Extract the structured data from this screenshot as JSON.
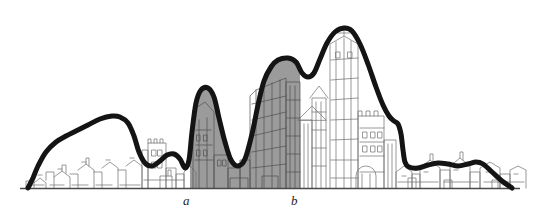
{
  "figure": {
    "type": "skyline-profile-diagram",
    "title": "",
    "background_color": "#ffffff",
    "ground_line_y": 188,
    "ground_line_color": "#4a4a4a",
    "profile_curve_color": "#141414",
    "profile_curve_width": 5,
    "shaded_zone_color": "#9b9b9b",
    "skyline_ink_color": "#6e6e6e"
  },
  "labels": [
    {
      "id": "a",
      "text": "a",
      "x": 186,
      "y": 204,
      "style": "italic"
    },
    {
      "id": "b",
      "text": "b",
      "x": 294,
      "y": 204,
      "style": "italic"
    }
  ],
  "chart_data": {
    "type": "area",
    "title": "",
    "xlabel": "",
    "ylabel": "",
    "grid": false,
    "legend": null,
    "annotations": [
      {
        "label": "a",
        "x": 186,
        "note": "left boundary of shaded high-density zone"
      },
      {
        "label": "b",
        "x": 300,
        "note": "right boundary of shaded high-density zone"
      }
    ],
    "shaded_region": {
      "from": 190,
      "to": 300
    },
    "profile_points": [
      [
        28,
        188
      ],
      [
        33,
        178
      ],
      [
        38,
        166
      ],
      [
        46,
        152
      ],
      [
        56,
        142
      ],
      [
        66,
        136
      ],
      [
        76,
        131
      ],
      [
        88,
        125
      ],
      [
        100,
        119
      ],
      [
        112,
        116
      ],
      [
        120,
        117
      ],
      [
        128,
        123
      ],
      [
        134,
        136
      ],
      [
        139,
        152
      ],
      [
        145,
        163
      ],
      [
        152,
        166
      ],
      [
        160,
        161
      ],
      [
        167,
        155
      ],
      [
        174,
        154
      ],
      [
        180,
        159
      ],
      [
        185,
        168
      ],
      [
        189,
        160
      ],
      [
        192,
        132
      ],
      [
        196,
        103
      ],
      [
        201,
        90
      ],
      [
        208,
        88
      ],
      [
        214,
        97
      ],
      [
        219,
        118
      ],
      [
        225,
        142
      ],
      [
        231,
        160
      ],
      [
        238,
        166
      ],
      [
        245,
        159
      ],
      [
        252,
        134
      ],
      [
        258,
        105
      ],
      [
        264,
        81
      ],
      [
        271,
        67
      ],
      [
        278,
        60
      ],
      [
        288,
        58
      ],
      [
        296,
        62
      ],
      [
        302,
        73
      ],
      [
        308,
        77
      ],
      [
        314,
        73
      ],
      [
        320,
        59
      ],
      [
        327,
        43
      ],
      [
        335,
        32
      ],
      [
        344,
        28
      ],
      [
        352,
        31
      ],
      [
        360,
        44
      ],
      [
        368,
        64
      ],
      [
        376,
        87
      ],
      [
        383,
        105
      ],
      [
        389,
        116
      ],
      [
        394,
        121
      ],
      [
        398,
        124
      ],
      [
        401,
        134
      ],
      [
        403,
        150
      ],
      [
        405,
        162
      ],
      [
        409,
        167
      ],
      [
        418,
        168
      ],
      [
        428,
        165
      ],
      [
        438,
        163
      ],
      [
        448,
        164
      ],
      [
        458,
        166
      ],
      [
        468,
        164
      ],
      [
        476,
        162
      ],
      [
        483,
        164
      ],
      [
        492,
        172
      ],
      [
        502,
        181
      ],
      [
        512,
        188
      ]
    ]
  },
  "skyline": {
    "description": "finely drawn architectural city elevation behind the profile curve",
    "left_low_town": {
      "from": 24,
      "to": 190
    },
    "tower_cluster": {
      "from": 190,
      "to": 300
    },
    "cathedral_towers": {
      "from": 300,
      "to": 400
    },
    "right_low_town": {
      "from": 400,
      "to": 516
    }
  }
}
